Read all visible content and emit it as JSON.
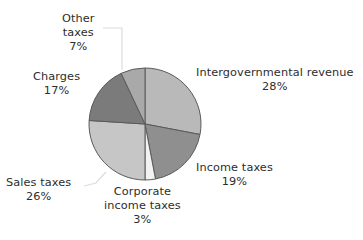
{
  "chart_data": {
    "type": "pie",
    "title": "",
    "subtitle": "",
    "xlabel": "",
    "ylabel": "",
    "legend_position": "none",
    "grid": false,
    "labels_mode": "outside-with-leader-lines",
    "start_angle_deg": 0,
    "direction": "clockwise",
    "categories": [
      "Intergovernmental revenue",
      "Income taxes",
      "Corporate income taxes",
      "Sales taxes",
      "Charges",
      "Other taxes"
    ],
    "values": [
      28,
      19,
      3,
      26,
      17,
      7
    ],
    "value_suffix": "%",
    "colors": [
      "#b9b9b9",
      "#8f8f8f",
      "#f2f2f2",
      "#c6c6c6",
      "#7b7b7b",
      "#a9a9a9"
    ],
    "slices": [
      {
        "name": "Intergovernmental revenue",
        "label_line1": "Intergovernmental revenue",
        "label_line2": "",
        "value": 28,
        "value_text": "28%",
        "color": "#b9b9b9",
        "leader_line": false
      },
      {
        "name": "Income taxes",
        "label_line1": "Income taxes",
        "label_line2": "",
        "value": 19,
        "value_text": "19%",
        "color": "#8f8f8f",
        "leader_line": false
      },
      {
        "name": "Corporate income taxes",
        "label_line1": "Corporate",
        "label_line2": "income taxes",
        "value": 3,
        "value_text": "3%",
        "color": "#f2f2f2",
        "leader_line": false
      },
      {
        "name": "Sales taxes",
        "label_line1": "Sales taxes",
        "label_line2": "",
        "value": 26,
        "value_text": "26%",
        "color": "#c6c6c6",
        "leader_line": true
      },
      {
        "name": "Charges",
        "label_line1": "Charges",
        "label_line2": "",
        "value": 17,
        "value_text": "17%",
        "color": "#7b7b7b",
        "leader_line": false
      },
      {
        "name": "Other taxes",
        "label_line1": "Other",
        "label_line2": "taxes",
        "value": 7,
        "value_text": "7%",
        "color": "#a9a9a9",
        "leader_line": true
      }
    ]
  },
  "style": {
    "background": "#ffffff",
    "slice_outline": "#5a5a5a",
    "leader_line_color": "#d9d9d9",
    "text_color": "#2d2d2d"
  },
  "geometry": {
    "center_x": 145,
    "center_y": 124,
    "radius": 56
  }
}
